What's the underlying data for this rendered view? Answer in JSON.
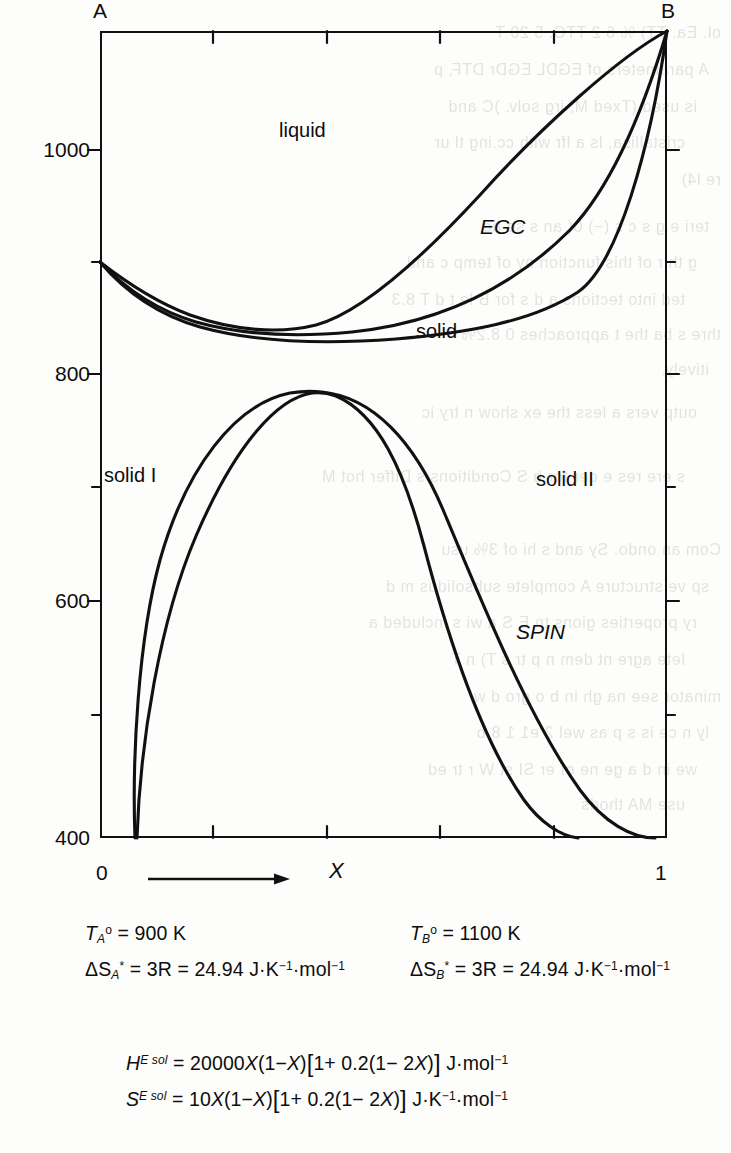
{
  "figure": {
    "type": "phase-diagram"
  },
  "axes": {
    "corner_left_label": "A",
    "corner_right_label": "B",
    "y": {
      "tick_labels": [
        "1000",
        "800",
        "600",
        "400"
      ],
      "tick_values": [
        1000,
        800,
        600,
        400
      ],
      "minor_tick_values": [
        900,
        700,
        500
      ],
      "range": [
        400,
        1150
      ],
      "unit": "K"
    },
    "x": {
      "start_label": "0",
      "end_label": "1",
      "axis_label": "X",
      "tick_values": [
        0,
        0.2,
        0.4,
        0.6,
        0.8,
        1
      ],
      "range": [
        0,
        1
      ]
    }
  },
  "region_labels": [
    {
      "text": "liquid",
      "italic": false
    },
    {
      "text": "EGC",
      "italic": true
    },
    {
      "text": "solid",
      "italic": false
    },
    {
      "text": "solid I",
      "italic": false
    },
    {
      "text": "solid II",
      "italic": false
    },
    {
      "text": "SPIN",
      "italic": true
    }
  ],
  "parameters": {
    "melting_A": {
      "symbol_T": "T",
      "sub": "A",
      "sup": "o",
      "equals": "= 900 K",
      "value": 900,
      "unit": "K"
    },
    "melting_B": {
      "symbol_T": "T",
      "sub": "B",
      "sup": "o",
      "equals": "= 1100 K",
      "value": 1100,
      "unit": "K"
    },
    "entropy_A": {
      "symbol": "ΔS",
      "sub": "A",
      "sup": "*",
      "equals": "= 3R = 24.94 J·K",
      "tail": "·mol",
      "value": 24.94,
      "unit": "J·K⁻¹·mol⁻¹"
    },
    "entropy_B": {
      "symbol": "ΔS",
      "sub": "B",
      "sup": "*",
      "equals": "= 3R = 24.94 J·K",
      "tail": "·mol",
      "value": 24.94,
      "unit": "J·K⁻¹·mol⁻¹"
    },
    "excess_enthalpy": {
      "lhs_symbol": "H",
      "lhs_sup": "E sol",
      "rhs_1": "= 20000",
      "rhs_X": "X",
      "rhs_2": "(1−",
      "rhs_X2": "X",
      "rhs_3": ")",
      "bracket_open": "[",
      "inner": "1+ 0.2(1− 2",
      "inner_X": "X",
      "inner_close": ")",
      "bracket_close": "]",
      "units": "J·mol",
      "full": "H^{E sol} = 20000 X(1-X)[1+0.2(1-2X)] J·mol⁻¹"
    },
    "excess_entropy": {
      "lhs_symbol": "S",
      "lhs_sup": "E sol",
      "rhs_1": "= 10",
      "rhs_X": "X",
      "rhs_2": "(1−",
      "rhs_X2": "X",
      "rhs_3": ")",
      "bracket_open": "[",
      "inner": "1+ 0.2(1− 2",
      "inner_X": "X",
      "inner_close": ")",
      "bracket_close": "]",
      "units_1": "J·K",
      "units_2": "·mol",
      "full": "S^{E sol} = 10 X(1-X)[1+0.2(1-2X)] J·K⁻¹·mol⁻¹"
    }
  },
  "bleed_through_lines": [
    "ol. Ea.  TT) %  6  2  TTC.    5  20  T",
    "A  parameters of  EGDL    EGDr  DTF,  p",
    "is  used  (Txed  M,     irg  solv.  )C    and",
    "cristallisa,   ls a        lfr  with  cc.ing  tl ur",
    "re   l4)",
    "teri e    g   s   c  s    (−)   0(  an    s  so  ac",
    "g  th r  of  this  function   ny  of  temp   c  and",
    "ted into  tections a  d  s  for  B  le  t  d  T  8.3",
    "thre   s   ba   the    t     approaches  0 8.2%",
    "itively.",
    "outp     vers a   less   the ex    show  n  try     ic",
    "s  ere  res  e  der  for  b    S    Conditions   s  Differ  hot  M",
    "Com  an  ondo.   Sy   and     s  hi   of 3%  usu",
    "sp       ve  structure   A  complete  subsolidus  m    d",
    "ry  properties  gions          tn     E     S  a  wi  s  included   a",
    "lete agre  nt  dem  n     p    tr   s    T)   n  T",
    "minator  see  na   gh    in    b   o   gro   d  w",
    "ly  n   ce is   s  p    as  wel   2   e1  1 8  b",
    "we  in   d  a     ge   ne  of  er  SI  st  W  r  tr  ed",
    "use MA  thods"
  ]
}
